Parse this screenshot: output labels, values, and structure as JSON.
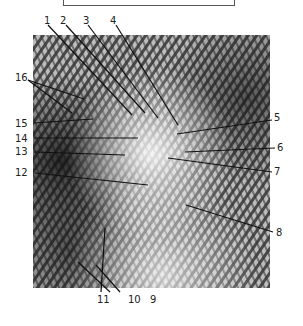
{
  "caption": {
    "visible_text": "Photomicrograph No. 2",
    "clipped": true
  },
  "figure": {
    "type": "labeled-micrograph",
    "colors": {
      "background": "#ffffff",
      "photo_dark": "#2a2a2a",
      "photo_light": "#e8e8e8",
      "leader_lines": "#111111",
      "label_text": "#222222"
    }
  },
  "labels": [
    {
      "id": "1",
      "text": "1"
    },
    {
      "id": "2",
      "text": "2"
    },
    {
      "id": "3",
      "text": "3"
    },
    {
      "id": "4",
      "text": "4"
    },
    {
      "id": "5",
      "text": "5"
    },
    {
      "id": "6",
      "text": "6"
    },
    {
      "id": "7",
      "text": "7"
    },
    {
      "id": "8",
      "text": "8"
    },
    {
      "id": "9",
      "text": "9"
    },
    {
      "id": "10",
      "text": "10"
    },
    {
      "id": "11",
      "text": "11"
    },
    {
      "id": "12",
      "text": "12"
    },
    {
      "id": "13",
      "text": "13"
    },
    {
      "id": "14",
      "text": "14"
    },
    {
      "id": "15",
      "text": "15"
    },
    {
      "id": "16",
      "text": "16"
    }
  ]
}
